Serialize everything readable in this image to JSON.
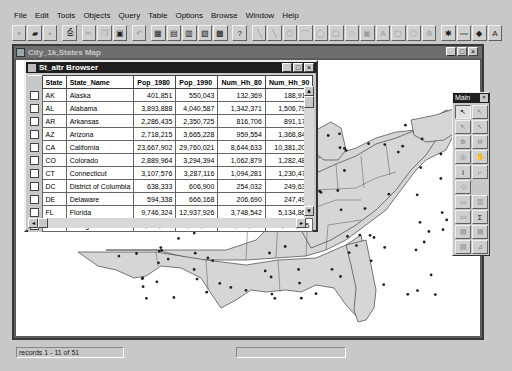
{
  "menu": [
    {
      "label": "File"
    },
    {
      "label": "Edit"
    },
    {
      "label": "Tools"
    },
    {
      "label": "Objects"
    },
    {
      "label": "Query"
    },
    {
      "label": "Table"
    },
    {
      "label": "Options"
    },
    {
      "label": "Browse"
    },
    {
      "label": "Window"
    },
    {
      "label": "Help"
    }
  ],
  "toolbar": {
    "buttons": [
      {
        "icon": "new-file-icon",
        "glyph": "▫",
        "enabled": true
      },
      {
        "icon": "open-folder-icon",
        "glyph": "▰",
        "enabled": true
      },
      {
        "icon": "save-icon",
        "glyph": "▪",
        "enabled": false
      },
      {
        "icon": "print-icon",
        "glyph": "⎙",
        "enabled": true
      },
      {
        "icon": "cut-icon",
        "glyph": "✂",
        "enabled": false
      },
      {
        "icon": "copy-icon",
        "glyph": "❐",
        "enabled": false
      },
      {
        "icon": "paste-icon",
        "glyph": "▣",
        "enabled": true
      },
      {
        "icon": "undo-icon",
        "glyph": "↶",
        "enabled": false
      },
      {
        "icon": "new-browser-icon",
        "glyph": "▦",
        "enabled": true
      },
      {
        "icon": "new-mapper-icon",
        "glyph": "▤",
        "enabled": true
      },
      {
        "icon": "new-grapher-icon",
        "glyph": "▥",
        "enabled": true
      },
      {
        "icon": "new-layout-icon",
        "glyph": "▧",
        "enabled": true
      },
      {
        "icon": "new-redistrict-icon",
        "glyph": "▩",
        "enabled": true
      },
      {
        "icon": "help-pointer-icon",
        "glyph": "?",
        "enabled": true
      },
      {
        "icon": "polyline-icon",
        "glyph": "╲",
        "enabled": false
      },
      {
        "icon": "line-icon",
        "glyph": "╲",
        "enabled": false
      },
      {
        "icon": "polygon-icon",
        "glyph": "⬠",
        "enabled": false
      },
      {
        "icon": "arc-icon",
        "glyph": "⌒",
        "enabled": false
      },
      {
        "icon": "ellipse-icon",
        "glyph": "◯",
        "enabled": false
      },
      {
        "icon": "rounded-rect-icon",
        "glyph": "▢",
        "enabled": false
      },
      {
        "icon": "rectangle-icon",
        "glyph": "□",
        "enabled": false
      },
      {
        "icon": "frame-icon",
        "glyph": "▣",
        "enabled": false
      },
      {
        "icon": "text-icon",
        "glyph": "A",
        "enabled": false
      },
      {
        "icon": "symbol-icon",
        "glyph": "▢",
        "enabled": false
      },
      {
        "icon": "reshape-icon",
        "glyph": "⬡",
        "enabled": false
      },
      {
        "icon": "add-node-icon",
        "glyph": "⊕",
        "enabled": false
      },
      {
        "icon": "symbol-style-icon",
        "glyph": "✱",
        "enabled": true
      },
      {
        "icon": "line-style-icon",
        "glyph": "〰",
        "enabled": true
      },
      {
        "icon": "region-style-icon",
        "glyph": "◆",
        "enabled": true
      },
      {
        "icon": "text-style-icon",
        "glyph": "A",
        "enabled": true
      }
    ]
  },
  "map_window": {
    "title": "City_1k,States Map",
    "minimize": "_",
    "maximize": "□",
    "close": "×"
  },
  "browser": {
    "title": "St_altr Browser",
    "minimize": "_",
    "maximize": "□",
    "close": "×",
    "columns": [
      "State",
      "State_Name",
      "Pop_1980",
      "Pop_1990",
      "Num_Hh_80",
      "Num_Hh_90"
    ],
    "rows": [
      [
        "AK",
        "Alaska",
        "401,851",
        "550,043",
        "132,369",
        "188,915"
      ],
      [
        "AL",
        "Alabama",
        "3,893,888",
        "4,040,587",
        "1,342,371",
        "1,506,790"
      ],
      [
        "AR",
        "Arkansas",
        "2,286,435",
        "2,350,725",
        "816,706",
        "891,179"
      ],
      [
        "AZ",
        "Arizona",
        "2,718,215",
        "3,665,228",
        "959,554",
        "1,368,843"
      ],
      [
        "CA",
        "California",
        "23,667,902",
        "29,760,021",
        "8,644,633",
        "10,381,206"
      ],
      [
        "CO",
        "Colorado",
        "2,889,964",
        "3,294,394",
        "1,062,879",
        "1,282,489"
      ],
      [
        "CT",
        "Connecticut",
        "3,107,576",
        "3,287,116",
        "1,094,281",
        "1,230,479"
      ],
      [
        "DC",
        "District of Columbia",
        "638,333",
        "606,900",
        "254,032",
        "249,634"
      ],
      [
        "DE",
        "Delaware",
        "594,338",
        "666,168",
        "206,690",
        "247,497"
      ],
      [
        "FL",
        "Florida",
        "9,746,324",
        "12,937,926",
        "3,748,542",
        "5,134,869"
      ],
      [
        "GA",
        "Georgia",
        "5,463,105",
        "6,478,216",
        "1,872,564",
        "2,366,615"
      ]
    ]
  },
  "palette": {
    "title": "Main",
    "close": "×",
    "tools": [
      {
        "icon": "select-arrow-icon",
        "glyph": "↖",
        "active": true
      },
      {
        "icon": "marquee-select-icon",
        "glyph": "↖",
        "active": false
      },
      {
        "icon": "radius-select-icon",
        "glyph": "↖",
        "active": false
      },
      {
        "icon": "boundary-select-icon",
        "glyph": "↖",
        "active": false
      },
      {
        "icon": "zoom-in-icon",
        "glyph": "⊕",
        "active": false
      },
      {
        "icon": "zoom-out-icon",
        "glyph": "⊖",
        "active": false
      },
      {
        "icon": "change-view-icon",
        "glyph": "◎",
        "active": false
      },
      {
        "icon": "grabber-icon",
        "glyph": "✋",
        "active": false
      },
      {
        "icon": "info-icon",
        "glyph": "i",
        "active": false
      },
      {
        "icon": "label-icon",
        "glyph": "⌐",
        "active": false
      },
      {
        "icon": "drag-map-icon",
        "glyph": "◇",
        "active": false
      },
      {
        "icon": "blank",
        "glyph": "",
        "active": false
      },
      {
        "icon": "ruler-icon",
        "glyph": "▭",
        "active": false
      },
      {
        "icon": "layer-control-icon",
        "glyph": "▥",
        "active": false
      },
      {
        "icon": "show-legend-icon",
        "glyph": "▭",
        "active": false
      },
      {
        "icon": "statistics-icon",
        "glyph": "Σ",
        "active": false
      },
      {
        "icon": "thematic-icon",
        "glyph": "▤",
        "active": false
      },
      {
        "icon": "theme-legend-icon",
        "glyph": "▤",
        "active": false
      },
      {
        "icon": "hotlink-icon",
        "glyph": "▧",
        "active": false
      },
      {
        "icon": "clip-icon",
        "glyph": "⊿",
        "active": false
      }
    ]
  },
  "status": {
    "records": "records 1 - 11 of 51",
    "panel2": ""
  }
}
